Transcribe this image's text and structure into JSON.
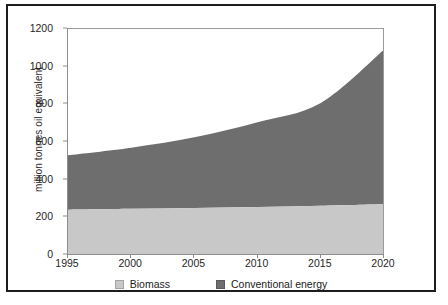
{
  "chart_data": {
    "type": "area",
    "stacked": true,
    "title": "",
    "xlabel": "",
    "ylabel": "million tonnes oil equivalent",
    "xlim": [
      1995,
      2020
    ],
    "ylim": [
      0,
      1200
    ],
    "grid": false,
    "legend_position": "bottom",
    "x": [
      1995,
      2000,
      2005,
      2010,
      2015,
      2020
    ],
    "xticklabels": [
      "1995",
      "2000",
      "2005",
      "2010",
      "2015",
      "2020"
    ],
    "yticklabels": [
      "0",
      "200",
      "400",
      "600",
      "800",
      "1000",
      "1200"
    ],
    "yticks": [
      0,
      200,
      400,
      600,
      800,
      1000,
      1200
    ],
    "series": [
      {
        "name": "Biomass",
        "color": "#c8c8c8",
        "values": [
          240,
          245,
          250,
          255,
          262,
          270
        ]
      },
      {
        "name": "Conventional energy",
        "color": "#6e6e6e",
        "values": [
          290,
          325,
          375,
          450,
          545,
          820
        ]
      }
    ],
    "totals": [
      530,
      570,
      625,
      705,
      807,
      1090
    ]
  },
  "legend": {
    "items": [
      {
        "label": "Biomass",
        "color": "#c8c8c8"
      },
      {
        "label": "Conventional energy",
        "color": "#6e6e6e"
      }
    ]
  },
  "axes": {
    "y_title": "million tonnes oil equivalent"
  }
}
